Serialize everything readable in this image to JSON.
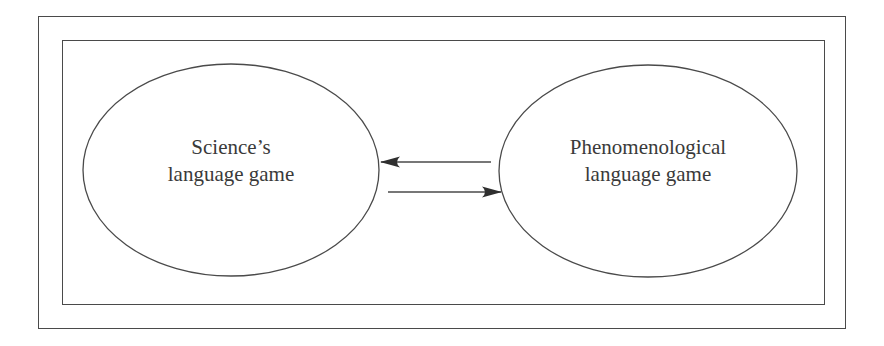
{
  "diagram": {
    "nodes": [
      {
        "id": "science",
        "lines": [
          "Science’s",
          "language game"
        ]
      },
      {
        "id": "phenomenological",
        "lines": [
          "Phenomenological",
          "language game"
        ]
      }
    ],
    "edges": [
      {
        "from": "phenomenological",
        "to": "science",
        "direction": "left"
      },
      {
        "from": "science",
        "to": "phenomenological",
        "direction": "right"
      }
    ],
    "colors": {
      "stroke": "#4a4a4a",
      "text": "#3a3a3a",
      "background": "#ffffff"
    }
  }
}
